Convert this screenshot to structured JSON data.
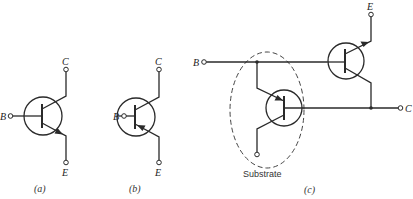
{
  "figure": {
    "panels": [
      {
        "id": "a",
        "caption": "(a)",
        "type": "NPN transistor",
        "terminals": {
          "base": "B",
          "collector": "C",
          "emitter": "E"
        }
      },
      {
        "id": "b",
        "caption": "(b)",
        "type": "PNP transistor",
        "terminals": {
          "base": "B",
          "collector": "C",
          "emitter": "E"
        }
      },
      {
        "id": "c",
        "caption": "(c)",
        "type": "Composite (complementary) transistor with substrate PNP",
        "terminals": {
          "base": "B",
          "collector": "C",
          "emitter": "E"
        },
        "annotation": "Substrate"
      }
    ]
  }
}
